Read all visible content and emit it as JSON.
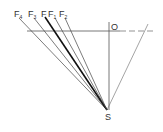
{
  "diagram": {
    "type": "perspective-ray-diagram",
    "colors": {
      "background": "#ffffff",
      "line": "#444444",
      "bold_line": "#111111"
    },
    "point_s": {
      "label": "S",
      "x": 107,
      "y": 110
    },
    "point_o": {
      "label": "O",
      "x": 109,
      "y": 31
    },
    "horizon": {
      "x1": 27,
      "y1": 31,
      "x2": 153,
      "y2": 31
    },
    "vertical": {
      "x1": 109,
      "y1": 22,
      "x2": 109,
      "y2": 110
    },
    "right_ray": {
      "x1": 107,
      "y1": 110,
      "x2": 148,
      "y2": 24
    },
    "rays": [
      {
        "label": "F",
        "sub": "4",
        "x": 19,
        "y": 18,
        "lx": 14,
        "ly": 17,
        "bold": false
      },
      {
        "label": "F",
        "sub": "3",
        "x": 34,
        "y": 18,
        "lx": 28,
        "ly": 17,
        "bold": false
      },
      {
        "label": "F",
        "sub": "",
        "x": 45,
        "y": 17,
        "lx": 41,
        "ly": 17,
        "bold": true
      },
      {
        "label": "F",
        "sub": "1",
        "x": 55,
        "y": 18,
        "lx": 48,
        "ly": 17,
        "bold": false
      },
      {
        "label": "F",
        "sub": "2",
        "x": 65,
        "y": 18,
        "lx": 59,
        "ly": 17,
        "bold": false
      }
    ]
  }
}
